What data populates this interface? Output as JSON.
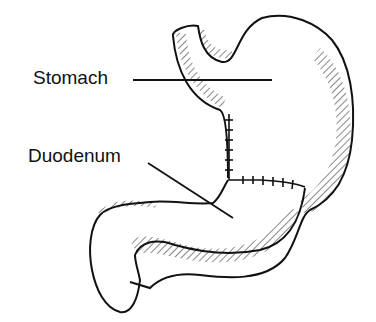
{
  "diagram": {
    "title": "",
    "labels": [
      {
        "id": "stomach",
        "text": "Stomach"
      },
      {
        "id": "duodenum",
        "text": "Duodenum"
      }
    ],
    "colors": {
      "ink": "#111111",
      "background": "#ffffff"
    }
  }
}
